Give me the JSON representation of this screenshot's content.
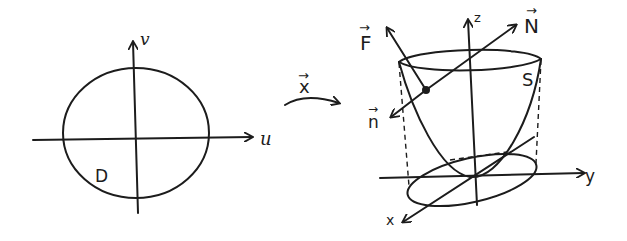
{
  "figure": {
    "colors": {
      "ink": "#1c1c1c",
      "background": "#ffffff"
    }
  },
  "domain_panel": {
    "axis_u_label": "u",
    "axis_v_label": "v",
    "region_label": "D"
  },
  "mapping": {
    "label": "x",
    "vector_arrow": "→"
  },
  "surface_panel": {
    "axis_x_label": "x",
    "axis_y_label": "y",
    "axis_z_label": "z",
    "surface_label": "S",
    "vector_F_label": "F",
    "vector_N_label": "N",
    "vector_n_label": "n",
    "vector_arrow": "→"
  }
}
